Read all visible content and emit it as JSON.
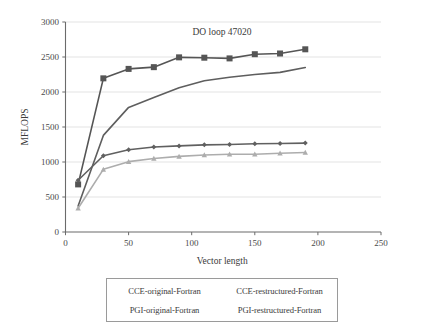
{
  "chart_data": {
    "type": "line",
    "title": "DO loop 47020",
    "xlabel": "Vector length",
    "ylabel": "MFLOPS",
    "xlim": [
      0,
      250
    ],
    "ylim": [
      0,
      3000
    ],
    "xticks": [
      "0",
      "50",
      "100",
      "150",
      "200",
      "250"
    ],
    "yticks": [
      "0",
      "500",
      "1000",
      "1500",
      "2000",
      "2500",
      "3000"
    ],
    "xtick_values": [
      0,
      50,
      100,
      150,
      200,
      250
    ],
    "ytick_values": [
      0,
      500,
      1000,
      1500,
      2000,
      2500,
      3000
    ],
    "grid": "horizontal",
    "legend_position": "below-plot",
    "x": [
      10,
      30,
      50,
      70,
      90,
      110,
      130,
      150,
      170,
      190
    ],
    "series": [
      {
        "name": "CCE-original-Fortran",
        "marker": "square",
        "color": "#555555",
        "values": [
          680,
          2195,
          2330,
          2355,
          2495,
          2490,
          2480,
          2540,
          2550,
          2610
        ]
      },
      {
        "name": "CCE-restructured-Fortran",
        "marker": "none",
        "color": "#5e5e5e",
        "values": [
          370,
          1380,
          1780,
          1920,
          2060,
          2160,
          2210,
          2250,
          2280,
          2350
        ]
      },
      {
        "name": "PGI-original-Fortran",
        "marker": "diamond",
        "color": "#606060",
        "values": [
          740,
          1090,
          1175,
          1215,
          1230,
          1245,
          1250,
          1260,
          1265,
          1270
        ]
      },
      {
        "name": "PGI-restructured-Fortran",
        "marker": "triangle",
        "color": "#adadad",
        "values": [
          340,
          895,
          1005,
          1050,
          1080,
          1100,
          1110,
          1110,
          1125,
          1135
        ]
      }
    ]
  },
  "legend": {
    "entries": [
      "CCE-original-Fortran",
      "CCE-restructured-Fortran",
      "PGI-original-Fortran",
      "PGI-restructured-Fortran"
    ]
  },
  "colors": {
    "axis": "#6b6b6b",
    "grid": "#dcdcdc",
    "text": "#3a3a3a"
  }
}
